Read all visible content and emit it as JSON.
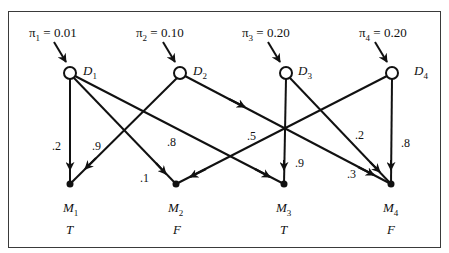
{
  "diagram": {
    "type": "bipartite-causal-network",
    "diseases": [
      {
        "id": "D1",
        "label": "D",
        "sub": "1",
        "prior_label": "π₁ = 0.01",
        "prior": 0.01
      },
      {
        "id": "D2",
        "label": "D",
        "sub": "2",
        "prior_label": "π₂ = 0.10",
        "prior": 0.1
      },
      {
        "id": "D3",
        "label": "D",
        "sub": "3",
        "prior_label": "π₃ = 0.20",
        "prior": 0.2
      },
      {
        "id": "D4",
        "label": "D",
        "sub": "4",
        "prior_label": "π₄ = 0.20",
        "prior": 0.2
      }
    ],
    "manifestations": [
      {
        "id": "M1",
        "label": "M",
        "sub": "1",
        "value": "T"
      },
      {
        "id": "M2",
        "label": "M",
        "sub": "2",
        "value": "F"
      },
      {
        "id": "M3",
        "label": "M",
        "sub": "3",
        "value": "T"
      },
      {
        "id": "M4",
        "label": "M",
        "sub": "4",
        "value": "F"
      }
    ],
    "edges": [
      {
        "from": "D1",
        "to": "M1",
        "weight": ".2"
      },
      {
        "from": "D1",
        "to": "M2",
        "weight": ".1"
      },
      {
        "from": "D1",
        "to": "M3",
        "weight": ".8"
      },
      {
        "from": "D2",
        "to": "M1",
        "weight": ".9"
      },
      {
        "from": "D2",
        "to": "M4",
        "weight": ".3"
      },
      {
        "from": "D3",
        "to": "M3",
        "weight": ".9"
      },
      {
        "from": "D3",
        "to": "M4",
        "weight": ".2"
      },
      {
        "from": "D4",
        "to": "M2",
        "weight": ".5"
      },
      {
        "from": "D4",
        "to": "M4",
        "weight": ".8"
      }
    ]
  },
  "labels": {
    "pi1": "π",
    "pi1_sub": "1",
    "pi1_val": " = 0.01",
    "pi2": "π",
    "pi2_sub": "2",
    "pi2_val": " = 0.10",
    "pi3": "π",
    "pi3_sub": "3",
    "pi3_val": " = 0.20",
    "pi4": "π",
    "pi4_sub": "4",
    "pi4_val": " = 0.20",
    "w_d1m1": ".2",
    "w_d2m1": ".9",
    "w_d1m3": ".8",
    "w_d1m2": ".1",
    "w_d4m2": ".5",
    "w_d3m3": ".9",
    "w_d3m4": ".2",
    "w_d4m4": ".8",
    "w_d2m4": ".3",
    "d": "D",
    "m": "M",
    "s1": "1",
    "s2": "2",
    "s3": "3",
    "s4": "4",
    "v1": "T",
    "v2": "F",
    "v3": "T",
    "v4": "F"
  },
  "colors": {
    "ink": "#111111",
    "frame": "#3a3a3a",
    "background": "#ffffff"
  }
}
